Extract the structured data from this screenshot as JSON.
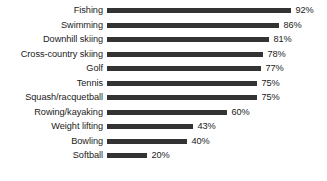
{
  "chart_data": {
    "type": "bar",
    "orientation": "horizontal",
    "title": "",
    "subtitle": "",
    "xlabel": "",
    "ylabel": "",
    "xlim": [
      0,
      100
    ],
    "grid": false,
    "legend": false,
    "value_suffix": "%",
    "categories": [
      "Fishing",
      "Swimming",
      "Downhill skiing",
      "Cross-country skiing",
      "Golf",
      "Tennis",
      "Squash/racquetball",
      "Rowing/kayaking",
      "Weight lifting",
      "Bowling",
      "Softball"
    ],
    "values": [
      92,
      86,
      81,
      78,
      77,
      75,
      75,
      60,
      43,
      40,
      20
    ],
    "value_labels": [
      "92%",
      "86%",
      "81%",
      "78%",
      "77%",
      "75%",
      "75%",
      "60%",
      "43%",
      "40%",
      "20%"
    ],
    "bars": [
      {
        "category": "Fishing",
        "value": 92,
        "label": "92%"
      },
      {
        "category": "Swimming",
        "value": 86,
        "label": "86%"
      },
      {
        "category": "Downhill skiing",
        "value": 81,
        "label": "81%"
      },
      {
        "category": "Cross-country skiing",
        "value": 78,
        "label": "78%"
      },
      {
        "category": "Golf",
        "value": 77,
        "label": "77%"
      },
      {
        "category": "Tennis",
        "value": 75,
        "label": "75%"
      },
      {
        "category": "Squash/racquetball",
        "value": 75,
        "label": "75%"
      },
      {
        "category": "Rowing/kayaking",
        "value": 60,
        "label": "60%"
      },
      {
        "category": "Weight lifting",
        "value": 43,
        "label": "43%"
      },
      {
        "category": "Bowling",
        "value": 40,
        "label": "40%"
      },
      {
        "category": "Softball",
        "value": 20,
        "label": "20%"
      }
    ],
    "colors": {
      "bar": "#333333",
      "text": "#1a1a1a",
      "background": "#ffffff"
    }
  },
  "layout": {
    "label_column_width": 103,
    "bar_origin_x": 107,
    "px_per_unit": 2.0,
    "row_pitch": 14.5,
    "first_row_center": 11,
    "bar_thickness": 5
  }
}
